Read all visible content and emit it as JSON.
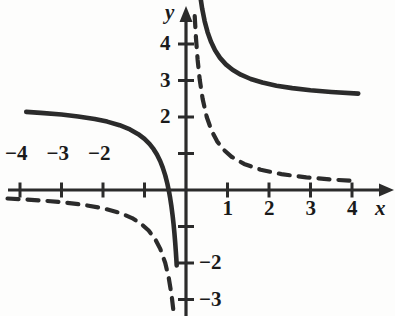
{
  "figure": {
    "kind": "cartesian-graph",
    "background_color": "#fdfdfc",
    "ink_color": "#2b2b2b",
    "axis_labels": {
      "x": "x",
      "y": "y"
    },
    "origin_px": {
      "x": 186,
      "y": 190
    },
    "unit_px": {
      "x": 41.5,
      "y": 36.5
    },
    "x_tick_labels": [
      {
        "text": "−4",
        "value": -4
      },
      {
        "text": "−3",
        "value": -3
      },
      {
        "text": "−2",
        "value": -2
      },
      {
        "text": "1",
        "value": 1
      },
      {
        "text": "2",
        "value": 2
      },
      {
        "text": "3",
        "value": 3
      },
      {
        "text": "4",
        "value": 4
      }
    ],
    "y_tick_labels": [
      {
        "text": "4",
        "value": 4
      },
      {
        "text": "3",
        "value": 3
      },
      {
        "text": "2",
        "value": 2
      },
      {
        "text": "−2",
        "value": -2
      },
      {
        "text": "−3",
        "value": -3
      }
    ],
    "unlabeled_ticks": {
      "x": [
        -1
      ],
      "y": [
        1,
        -1
      ]
    }
  },
  "chart_data": {
    "type": "line",
    "title": "",
    "subtitle": "",
    "xlabel": "x",
    "ylabel": "y",
    "xlim": [
      -4.6,
      4.7
    ],
    "ylim": [
      -3.4,
      4.9
    ],
    "grid": false,
    "legend": "none",
    "x_ticks": [
      -4,
      -3,
      -2,
      -1,
      1,
      2,
      3,
      4
    ],
    "y_ticks": [
      4,
      3,
      2,
      1,
      -1,
      -2,
      -3
    ],
    "annotations": [
      "vertical asymptote at x = 0",
      "dashed curve horizontal asymptote y = 0",
      "solid curve horizontal asymptote y = 2.4"
    ],
    "series": [
      {
        "name": "y = 1/x",
        "style": "dashed",
        "color": "#2b2b2b",
        "width_px": 4.2,
        "dash_pattern": "11 9",
        "vertical_asymptote": 0,
        "horizontal_asymptote": 0,
        "branches": [
          {
            "name": "left-branch",
            "x_range": [
              -4.3,
              -0.062
            ],
            "points": [
              [
                -4.3,
                -0.233
              ],
              [
                -4.0,
                -0.25
              ],
              [
                -3.5,
                -0.286
              ],
              [
                -3.0,
                -0.333
              ],
              [
                -2.5,
                -0.4
              ],
              [
                -2.0,
                -0.5
              ],
              [
                -1.6,
                -0.625
              ],
              [
                -1.3,
                -0.769
              ],
              [
                -1.1,
                -0.909
              ],
              [
                -0.9,
                -1.111
              ],
              [
                -0.75,
                -1.333
              ],
              [
                -0.62,
                -1.613
              ],
              [
                -0.5,
                -2.0
              ],
              [
                -0.42,
                -2.381
              ],
              [
                -0.35,
                -2.857
              ],
              [
                -0.3,
                -3.333
              ]
            ]
          },
          {
            "name": "right-branch",
            "x_range": [
              0.21,
              4.1
            ],
            "points": [
              [
                0.21,
                4.762
              ],
              [
                0.24,
                4.167
              ],
              [
                0.28,
                3.571
              ],
              [
                0.33,
                3.03
              ],
              [
                0.4,
                2.5
              ],
              [
                0.5,
                2.0
              ],
              [
                0.62,
                1.613
              ],
              [
                0.75,
                1.333
              ],
              [
                0.9,
                1.111
              ],
              [
                1.1,
                0.909
              ],
              [
                1.4,
                0.714
              ],
              [
                1.8,
                0.556
              ],
              [
                2.3,
                0.435
              ],
              [
                2.9,
                0.345
              ],
              [
                3.5,
                0.286
              ],
              [
                4.1,
                0.244
              ]
            ]
          }
        ]
      },
      {
        "name": "y = 1/x + 2.4",
        "style": "solid",
        "color": "#2b2b2b",
        "width_px": 4.6,
        "vertical_asymptote": 0,
        "horizontal_asymptote": 2.4,
        "branches": [
          {
            "name": "left-branch",
            "x_range": [
              -3.85,
              -0.1
            ],
            "points": [
              [
                -3.85,
                2.14
              ],
              [
                -3.5,
                2.114
              ],
              [
                -3.0,
                2.067
              ],
              [
                -2.6,
                2.015
              ],
              [
                -2.2,
                1.945
              ],
              [
                -1.9,
                1.874
              ],
              [
                -1.6,
                1.775
              ],
              [
                -1.35,
                1.659
              ],
              [
                -1.15,
                1.53
              ],
              [
                -1.0,
                1.4
              ],
              [
                -0.88,
                1.264
              ],
              [
                -0.78,
                1.118
              ],
              [
                -0.7,
                0.971
              ],
              [
                -0.62,
                0.787
              ],
              [
                -0.56,
                0.614
              ],
              [
                -0.5,
                0.4
              ],
              [
                -0.45,
                0.178
              ],
              [
                -0.41,
                -0.039
              ],
              [
                -0.38,
                -0.232
              ],
              [
                -0.35,
                -0.457
              ],
              [
                -0.32,
                -0.725
              ],
              [
                -0.3,
                -0.933
              ],
              [
                -0.28,
                -1.171
              ],
              [
                -0.26,
                -1.446
              ],
              [
                -0.245,
                -1.682
              ],
              [
                -0.233,
                -1.891
              ],
              [
                -0.224,
                -2.064
              ]
            ]
          },
          {
            "name": "right-branch",
            "x_range": [
              0.2,
              4.15
            ],
            "points": [
              [
                0.2,
                7.4
              ],
              [
                0.21,
                7.162
              ],
              [
                0.225,
                6.844
              ],
              [
                0.245,
                6.482
              ],
              [
                0.27,
                6.104
              ],
              [
                0.3,
                5.733
              ],
              [
                0.34,
                5.341
              ],
              [
                0.39,
                4.964
              ],
              [
                0.45,
                4.622
              ],
              [
                0.52,
                4.323
              ],
              [
                0.6,
                4.067
              ],
              [
                0.7,
                3.829
              ],
              [
                0.82,
                3.62
              ],
              [
                0.96,
                3.442
              ],
              [
                1.12,
                3.293
              ],
              [
                1.32,
                3.158
              ],
              [
                1.56,
                3.041
              ],
              [
                1.84,
                2.944
              ],
              [
                2.18,
                2.859
              ],
              [
                2.56,
                2.791
              ],
              [
                3.0,
                2.733
              ],
              [
                3.5,
                2.686
              ],
              [
                4.15,
                2.641
              ]
            ]
          }
        ]
      }
    ]
  }
}
